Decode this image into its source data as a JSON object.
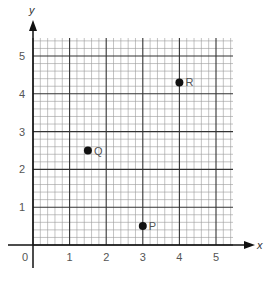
{
  "chart_data": {
    "type": "scatter",
    "title": "",
    "xlabel": "x",
    "ylabel": "y",
    "xlim": [
      0,
      5.5
    ],
    "ylim": [
      0,
      5.5
    ],
    "grid": true,
    "grid_minor_step": 0.2,
    "grid_major_step": 1,
    "x_ticks": [
      "0",
      "1",
      "2",
      "3",
      "4",
      "5"
    ],
    "y_ticks": [
      "1",
      "2",
      "3",
      "4",
      "5"
    ],
    "points": [
      {
        "label": "P",
        "x": 3,
        "y": 0.5
      },
      {
        "label": "Q",
        "x": 1.5,
        "y": 2.5
      },
      {
        "label": "R",
        "x": 4,
        "y": 4.3
      }
    ]
  },
  "colors": {
    "axis": "#111111",
    "major_grid": "#333333",
    "minor_grid": "#9a9a9a",
    "point": "#111111",
    "point_label": "#777777"
  }
}
